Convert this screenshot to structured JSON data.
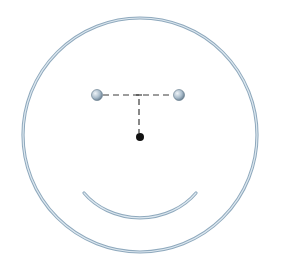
{
  "diagram": {
    "type": "smiley-face-geometry",
    "colors": {
      "background": "#ffffff",
      "outline_outer": "#8fa9bd",
      "outline_inner": "#dde8f0",
      "eye_highlight": "#eef3f7",
      "eye_mid": "#a9bccb",
      "eye_dark": "#5d7385",
      "dash": "#3a3a3a",
      "center_dot": "#111111"
    },
    "face": {
      "cx": 140,
      "cy": 135,
      "r": 117
    },
    "eyes": [
      {
        "name": "left-eye",
        "cx": 97,
        "cy": 95,
        "r": 5.5
      },
      {
        "name": "right-eye",
        "cx": 179,
        "cy": 95,
        "r": 5.5
      }
    ],
    "eye_connector": {
      "x1": 103,
      "y1": 95,
      "x2": 173,
      "y2": 95
    },
    "vertical_connector": {
      "x1": 139,
      "y1": 95,
      "x2": 139,
      "y2": 133
    },
    "center_dot": {
      "cx": 140,
      "cy": 137,
      "r": 4
    },
    "mouth": {
      "x1": 84,
      "y1": 193,
      "x2": 196,
      "y2": 193,
      "rx": 70,
      "ry": 62
    }
  }
}
